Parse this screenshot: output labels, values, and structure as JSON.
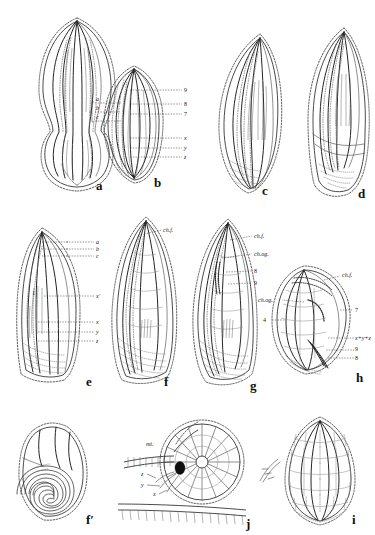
{
  "plate": {
    "kind": "scientific-illustration-plate",
    "subject": "foraminifera / microfossil test morphology",
    "background_color": "#ffffff",
    "ink_color": "#1a1a1a",
    "width": 375,
    "height": 535
  },
  "panels": [
    {
      "id": "a",
      "letter": "a",
      "label_x": 96,
      "label_y": 186
    },
    {
      "id": "b",
      "letter": "b",
      "label_x": 156,
      "label_y": 186
    },
    {
      "id": "c",
      "letter": "c",
      "label_x": 262,
      "label_y": 193
    },
    {
      "id": "d",
      "letter": "d",
      "label_x": 360,
      "label_y": 196
    },
    {
      "id": "e",
      "letter": "e",
      "label_x": 90,
      "label_y": 382
    },
    {
      "id": "f",
      "letter": "f",
      "label_x": 167,
      "label_y": 382
    },
    {
      "id": "g",
      "letter": "g",
      "label_x": 253,
      "label_y": 384
    },
    {
      "id": "h",
      "letter": "h",
      "label_x": 361,
      "label_y": 380
    },
    {
      "id": "f_prime",
      "letter": "f′",
      "label_x": 92,
      "label_y": 522
    },
    {
      "id": "j",
      "letter": "j",
      "label_x": 246,
      "label_y": 524
    },
    {
      "id": "i",
      "letter": "i",
      "label_x": 354,
      "label_y": 522
    }
  ],
  "labels": {
    "b_left_bracket": [
      "a",
      "b",
      "c"
    ],
    "b_right": [
      "9",
      "8",
      "7",
      "x",
      "y",
      "z"
    ],
    "e_top_bracket": [
      "a",
      "b",
      "c"
    ],
    "e_right": [
      "x′",
      "x",
      "y",
      "z"
    ],
    "e_inner": "1",
    "f_leaders": [
      "ch.f."
    ],
    "g_leaders": [
      "ch.f.",
      "ch.og.",
      "8",
      "9"
    ],
    "h_leaders": [
      "ch.f.",
      "ch.og.",
      "7",
      "x+y+z",
      "9",
      "8",
      "4"
    ],
    "j_leaders": [
      "mi.",
      "z",
      "y",
      "x"
    ]
  },
  "annotation_glossary": {
    "ch.f.": "chamber / final chamber",
    "ch.og.": "chamber, older generation",
    "mi.": "microspheric initial chamber",
    "x": "costa x",
    "y": "costa y",
    "z": "costa z",
    "x+y+z": "combined costae x, y and z"
  }
}
